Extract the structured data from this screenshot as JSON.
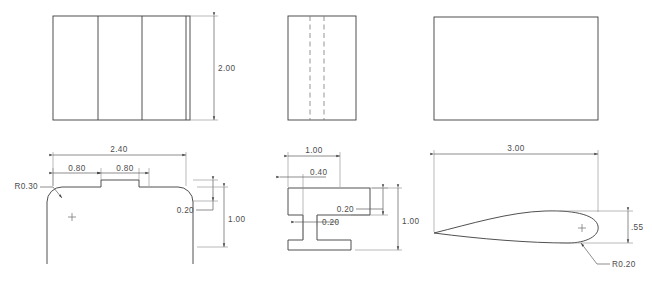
{
  "document": {
    "title": "Orthographic Part Drawing Sheet",
    "sheet_background": "#ffffff",
    "line_color": "#3c3c3c",
    "dimension_color": "#4d4d4d",
    "hidden_line_color": "#7a7a7a"
  },
  "views": {
    "top_left": {
      "name": "Stepped Block - Top View",
      "dimensions": [
        {
          "id": "height",
          "label": "2.00",
          "orientation": "vertical",
          "position": "right"
        }
      ]
    },
    "top_middle": {
      "name": "I-Beam - Top View",
      "dimensions": [],
      "hidden_lines": 2
    },
    "top_right": {
      "name": "Airfoil - Top View",
      "dimensions": []
    },
    "bottom_left": {
      "name": "Stepped Block - Front Profile",
      "dimensions": [
        {
          "id": "overall-width",
          "label": "2.40",
          "orientation": "horizontal"
        },
        {
          "id": "left-step",
          "label": "0.80",
          "orientation": "horizontal"
        },
        {
          "id": "right-step",
          "label": "0.80",
          "orientation": "horizontal"
        },
        {
          "id": "boss-height",
          "label": "0.20",
          "orientation": "vertical"
        },
        {
          "id": "overall-height",
          "label": "1.00",
          "orientation": "vertical"
        },
        {
          "id": "corner-radius",
          "label": "R0.30",
          "orientation": "leader"
        }
      ]
    },
    "bottom_middle": {
      "name": "I-Beam - Front Profile",
      "dimensions": [
        {
          "id": "flange-width",
          "label": "1.00",
          "orientation": "horizontal"
        },
        {
          "id": "web-offset",
          "label": "0.40",
          "orientation": "horizontal"
        },
        {
          "id": "web-thickness",
          "label": "0.20",
          "orientation": "horizontal"
        },
        {
          "id": "flange-thickness",
          "label": "0.20",
          "orientation": "vertical"
        },
        {
          "id": "overall-height",
          "label": "1.00",
          "orientation": "vertical"
        }
      ]
    },
    "bottom_right": {
      "name": "Airfoil - Front Profile",
      "dimensions": [
        {
          "id": "chord-length",
          "label": "3.00",
          "orientation": "horizontal"
        },
        {
          "id": "max-thickness",
          "label": ".55",
          "orientation": "vertical"
        },
        {
          "id": "trailing-edge-radius",
          "label": "R0.20",
          "orientation": "leader"
        }
      ]
    }
  }
}
